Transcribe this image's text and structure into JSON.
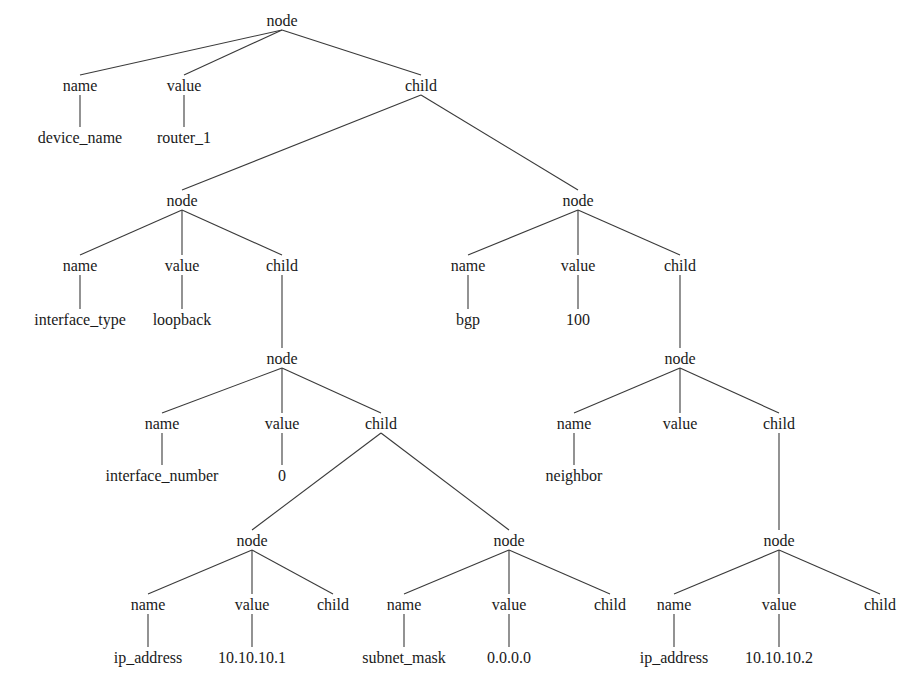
{
  "diagram": {
    "type": "tree",
    "description_visible": "parse tree of router configuration",
    "nodes": [
      {
        "id": "n0",
        "label": "node",
        "x": 282,
        "y": 20
      },
      {
        "id": "n1",
        "label": "name",
        "x": 80,
        "y": 85
      },
      {
        "id": "n2",
        "label": "value",
        "x": 184,
        "y": 85
      },
      {
        "id": "n3",
        "label": "child",
        "x": 421,
        "y": 85
      },
      {
        "id": "n4",
        "label": "device_name",
        "x": 80,
        "y": 137
      },
      {
        "id": "n5",
        "label": "router_1",
        "x": 184,
        "y": 137
      },
      {
        "id": "n6",
        "label": "node",
        "x": 182,
        "y": 200
      },
      {
        "id": "n7",
        "label": "node",
        "x": 578,
        "y": 200
      },
      {
        "id": "n8",
        "label": "name",
        "x": 80,
        "y": 265
      },
      {
        "id": "n9",
        "label": "value",
        "x": 182,
        "y": 265
      },
      {
        "id": "n10",
        "label": "child",
        "x": 282,
        "y": 265
      },
      {
        "id": "n11",
        "label": "interface_type",
        "x": 80,
        "y": 319
      },
      {
        "id": "n12",
        "label": "loopback",
        "x": 182,
        "y": 319
      },
      {
        "id": "n13",
        "label": "name",
        "x": 468,
        "y": 265
      },
      {
        "id": "n14",
        "label": "value",
        "x": 578,
        "y": 265
      },
      {
        "id": "n15",
        "label": "child",
        "x": 680,
        "y": 265
      },
      {
        "id": "n16",
        "label": "bgp",
        "x": 468,
        "y": 319
      },
      {
        "id": "n17",
        "label": "100",
        "x": 578,
        "y": 319
      },
      {
        "id": "n18",
        "label": "node",
        "x": 282,
        "y": 358
      },
      {
        "id": "n19",
        "label": "name",
        "x": 162,
        "y": 423
      },
      {
        "id": "n20",
        "label": "value",
        "x": 282,
        "y": 423
      },
      {
        "id": "n21",
        "label": "child",
        "x": 381,
        "y": 423
      },
      {
        "id": "n22",
        "label": "interface_number",
        "x": 162,
        "y": 475
      },
      {
        "id": "n23",
        "label": "0",
        "x": 282,
        "y": 475
      },
      {
        "id": "n24",
        "label": "node",
        "x": 680,
        "y": 358
      },
      {
        "id": "n25",
        "label": "name",
        "x": 574,
        "y": 423
      },
      {
        "id": "n26",
        "label": "value",
        "x": 680,
        "y": 423
      },
      {
        "id": "n27",
        "label": "child",
        "x": 779,
        "y": 423
      },
      {
        "id": "n28",
        "label": "neighbor",
        "x": 574,
        "y": 475
      },
      {
        "id": "n29",
        "label": "node",
        "x": 252,
        "y": 540
      },
      {
        "id": "n30",
        "label": "name",
        "x": 148,
        "y": 604
      },
      {
        "id": "n31",
        "label": "value",
        "x": 252,
        "y": 604
      },
      {
        "id": "n32",
        "label": "child",
        "x": 333,
        "y": 604
      },
      {
        "id": "n33",
        "label": "ip_address",
        "x": 148,
        "y": 657
      },
      {
        "id": "n34",
        "label": "10.10.10.1",
        "x": 252,
        "y": 657
      },
      {
        "id": "n35",
        "label": "node",
        "x": 509,
        "y": 540
      },
      {
        "id": "n36",
        "label": "name",
        "x": 404,
        "y": 604
      },
      {
        "id": "n37",
        "label": "value",
        "x": 509,
        "y": 604
      },
      {
        "id": "n38",
        "label": "child",
        "x": 610,
        "y": 604
      },
      {
        "id": "n39",
        "label": "subnet_mask",
        "x": 404,
        "y": 657
      },
      {
        "id": "n40",
        "label": "0.0.0.0",
        "x": 509,
        "y": 657
      },
      {
        "id": "n41",
        "label": "node",
        "x": 779,
        "y": 540
      },
      {
        "id": "n42",
        "label": "name",
        "x": 674,
        "y": 604
      },
      {
        "id": "n43",
        "label": "value",
        "x": 779,
        "y": 604
      },
      {
        "id": "n44",
        "label": "child",
        "x": 880,
        "y": 604
      },
      {
        "id": "n45",
        "label": "ip_address",
        "x": 674,
        "y": 657
      },
      {
        "id": "n46",
        "label": "10.10.10.2",
        "x": 779,
        "y": 657
      }
    ],
    "edges": [
      [
        "n0",
        "n1"
      ],
      [
        "n0",
        "n2"
      ],
      [
        "n0",
        "n3"
      ],
      [
        "n1",
        "n4"
      ],
      [
        "n2",
        "n5"
      ],
      [
        "n3",
        "n6"
      ],
      [
        "n3",
        "n7"
      ],
      [
        "n6",
        "n8"
      ],
      [
        "n6",
        "n9"
      ],
      [
        "n6",
        "n10"
      ],
      [
        "n8",
        "n11"
      ],
      [
        "n9",
        "n12"
      ],
      [
        "n7",
        "n13"
      ],
      [
        "n7",
        "n14"
      ],
      [
        "n7",
        "n15"
      ],
      [
        "n13",
        "n16"
      ],
      [
        "n14",
        "n17"
      ],
      [
        "n10",
        "n18"
      ],
      [
        "n18",
        "n19"
      ],
      [
        "n18",
        "n20"
      ],
      [
        "n18",
        "n21"
      ],
      [
        "n19",
        "n22"
      ],
      [
        "n20",
        "n23"
      ],
      [
        "n15",
        "n24"
      ],
      [
        "n24",
        "n25"
      ],
      [
        "n24",
        "n26"
      ],
      [
        "n24",
        "n27"
      ],
      [
        "n25",
        "n28"
      ],
      [
        "n21",
        "n29"
      ],
      [
        "n21",
        "n35"
      ],
      [
        "n29",
        "n30"
      ],
      [
        "n29",
        "n31"
      ],
      [
        "n29",
        "n32"
      ],
      [
        "n30",
        "n33"
      ],
      [
        "n31",
        "n34"
      ],
      [
        "n35",
        "n36"
      ],
      [
        "n35",
        "n37"
      ],
      [
        "n35",
        "n38"
      ],
      [
        "n36",
        "n39"
      ],
      [
        "n37",
        "n40"
      ],
      [
        "n27",
        "n41"
      ],
      [
        "n41",
        "n42"
      ],
      [
        "n41",
        "n43"
      ],
      [
        "n41",
        "n44"
      ],
      [
        "n42",
        "n45"
      ],
      [
        "n43",
        "n46"
      ]
    ],
    "colors": {
      "background": "#ffffff",
      "line": "#3a3a3a",
      "text": "#1a1a1a"
    }
  }
}
